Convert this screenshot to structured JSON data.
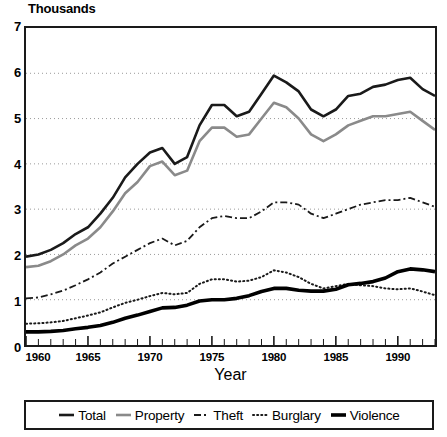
{
  "chart_data": {
    "type": "line",
    "title": "",
    "ylabel": "Thousands",
    "xlabel": "Year",
    "xlim": [
      1960,
      1993
    ],
    "ylim": [
      0,
      7
    ],
    "grid": "horizontal-dotted",
    "legend_position": "bottom",
    "x": [
      1960,
      1961,
      1962,
      1963,
      1964,
      1965,
      1966,
      1967,
      1968,
      1969,
      1970,
      1971,
      1972,
      1973,
      1974,
      1975,
      1976,
      1977,
      1978,
      1979,
      1980,
      1981,
      1982,
      1983,
      1984,
      1985,
      1986,
      1987,
      1988,
      1989,
      1990,
      1991,
      1992,
      1993
    ],
    "xticks": [
      1960,
      1965,
      1970,
      1975,
      1980,
      1985,
      1990
    ],
    "yticks": [
      0,
      1,
      2,
      3,
      4,
      5,
      6,
      7
    ],
    "series": [
      {
        "name": "Total",
        "style": "solid",
        "color": "#1a1a1a",
        "width": 2.6,
        "values": [
          1.95,
          2.0,
          2.1,
          2.25,
          2.45,
          2.6,
          2.9,
          3.25,
          3.7,
          4.0,
          4.25,
          4.35,
          4.0,
          4.15,
          4.85,
          5.3,
          5.3,
          5.05,
          5.15,
          5.55,
          5.95,
          5.8,
          5.6,
          5.2,
          5.05,
          5.2,
          5.5,
          5.55,
          5.7,
          5.75,
          5.85,
          5.9,
          5.65,
          5.5
        ]
      },
      {
        "name": "Property",
        "style": "solid",
        "color": "#8a8a8a",
        "width": 2.6,
        "values": [
          1.72,
          1.75,
          1.85,
          2.0,
          2.2,
          2.35,
          2.6,
          2.95,
          3.35,
          3.6,
          3.95,
          4.05,
          3.75,
          3.85,
          4.5,
          4.8,
          4.8,
          4.6,
          4.65,
          5.0,
          5.35,
          5.25,
          5.0,
          4.65,
          4.5,
          4.65,
          4.85,
          4.95,
          5.05,
          5.05,
          5.1,
          5.15,
          4.95,
          4.75
        ]
      },
      {
        "name": "Theft",
        "style": "dashdot",
        "color": "#1a1a1a",
        "width": 1.8,
        "values": [
          1.03,
          1.05,
          1.12,
          1.2,
          1.32,
          1.45,
          1.6,
          1.8,
          1.95,
          2.1,
          2.25,
          2.35,
          2.2,
          2.3,
          2.6,
          2.8,
          2.85,
          2.8,
          2.8,
          2.95,
          3.15,
          3.15,
          3.1,
          2.9,
          2.8,
          2.9,
          3.0,
          3.1,
          3.15,
          3.2,
          3.2,
          3.25,
          3.15,
          3.05
        ]
      },
      {
        "name": "Burglary",
        "style": "dotted",
        "color": "#1a1a1a",
        "width": 2.0,
        "values": [
          0.47,
          0.48,
          0.5,
          0.53,
          0.59,
          0.65,
          0.72,
          0.83,
          0.93,
          1.0,
          1.08,
          1.15,
          1.12,
          1.15,
          1.35,
          1.45,
          1.45,
          1.4,
          1.42,
          1.5,
          1.65,
          1.6,
          1.5,
          1.35,
          1.25,
          1.3,
          1.35,
          1.32,
          1.3,
          1.25,
          1.23,
          1.25,
          1.18,
          1.1
        ]
      },
      {
        "name": "Violence",
        "style": "solid",
        "color": "#000000",
        "width": 3.6,
        "values": [
          0.29,
          0.29,
          0.3,
          0.32,
          0.36,
          0.39,
          0.43,
          0.5,
          0.59,
          0.66,
          0.74,
          0.82,
          0.83,
          0.88,
          0.97,
          1.0,
          1.0,
          1.03,
          1.09,
          1.18,
          1.25,
          1.25,
          1.21,
          1.19,
          1.19,
          1.23,
          1.33,
          1.36,
          1.4,
          1.48,
          1.62,
          1.68,
          1.66,
          1.62
        ]
      }
    ]
  },
  "legend": {
    "items": [
      {
        "label": "Total",
        "swatch": "solid-dark-line"
      },
      {
        "label": "Property",
        "swatch": "solid-gray-line"
      },
      {
        "label": "Theft",
        "swatch": "dashdot-line"
      },
      {
        "label": "Burglary",
        "swatch": "dotted-line"
      },
      {
        "label": "Violence",
        "swatch": "thick-solid-line"
      }
    ]
  }
}
